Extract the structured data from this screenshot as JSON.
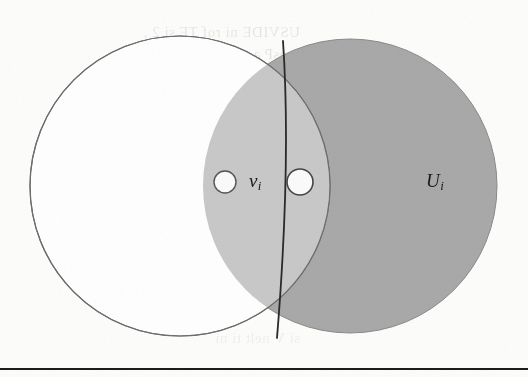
{
  "figure": {
    "kind": "venn-two-circles",
    "caption_rule": true,
    "labels": [
      {
        "id": "set-v",
        "base": "v",
        "subscript": "i",
        "x": 249,
        "y": 170
      },
      {
        "id": "set-U",
        "base": "U",
        "subscript": "i",
        "x": 426,
        "y": 170
      }
    ],
    "circles": [
      {
        "id": "left-circle",
        "cx": 180,
        "cy": 186,
        "r": 150,
        "fill": "#ffffff",
        "stroke": "#6e6e6e"
      },
      {
        "id": "right-circle",
        "cx": 350,
        "cy": 186,
        "r": 147,
        "fill": "#a9a9a9",
        "stroke": "#8a8a8a"
      }
    ],
    "lens": {
      "id": "intersection-lens",
      "fill": "#c9c9c9"
    },
    "divider": {
      "id": "divider-arc",
      "x1": 283,
      "y1": 41,
      "x2": 277,
      "y2": 338,
      "stroke": "#2a2a2a",
      "width": 1.8
    },
    "nodes": [
      {
        "id": "node-left",
        "cx": 225,
        "cy": 182,
        "r": 11,
        "fill": "#fbfbfb",
        "stroke": "#555555"
      },
      {
        "id": "node-right",
        "cx": 300,
        "cy": 182,
        "r": 13,
        "fill": "#fbfbfb",
        "stroke": "#444444"
      }
    ],
    "rule": {
      "id": "bottom-rule",
      "y": 368,
      "height": 2,
      "color": "#1c1c1c"
    }
  },
  "colors": {
    "page_background": "#fdfdfc",
    "light_region": "#c9c9c9",
    "dark_region": "#a9a9a9",
    "outline": "#6e6e6e",
    "divider": "#2a2a2a",
    "rule": "#1c1c1c",
    "text": "#1a1a1a"
  },
  "showthrough": {
    "note": "mirrored bleed-through text from the reverse side of the scanned page",
    "lines": [
      "USVIDE ni rof  TF  si  2  ,",
      "resP  a si    V  moU  rof  ",
      "VI  dna   ni   si   T  ",
      "UM   nelt   ti    si   V",
      "ne  ti  V  eb    ni   rof",
      "si  V   nelt   ti   ni"
    ]
  }
}
